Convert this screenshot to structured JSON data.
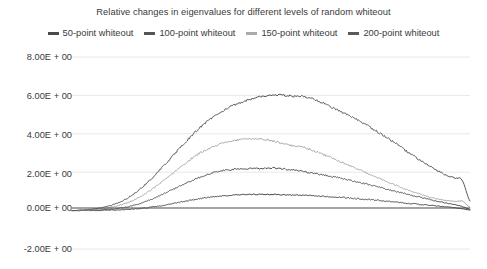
{
  "chart_data": {
    "type": "line",
    "title": "Relative changes in eigenvalues for different levels of random whiteout",
    "xlabel": "",
    "ylabel": "",
    "grid": true,
    "legend_position": "top",
    "ylim": [
      -2.0,
      8.0
    ],
    "ytick_labels": [
      "8.00E + 00",
      "6.00E + 00",
      "4.00E + 00",
      "2.00E + 00",
      "0.00E + 00",
      "-2.00E + 00"
    ],
    "ytick_values": [
      8.0,
      6.0,
      4.0,
      2.0,
      0.0,
      -2.0
    ],
    "xlim": [
      0,
      100
    ],
    "xtick_labels": [],
    "x": [
      0,
      2,
      4,
      6,
      8,
      10,
      12,
      14,
      16,
      18,
      20,
      22,
      24,
      26,
      28,
      30,
      32,
      34,
      36,
      38,
      40,
      42,
      44,
      46,
      48,
      50,
      52,
      54,
      56,
      58,
      60,
      62,
      64,
      66,
      68,
      70,
      72,
      74,
      76,
      78,
      80,
      82,
      84,
      86,
      88,
      90,
      92,
      94,
      96,
      98,
      100
    ],
    "series": [
      {
        "name": "50-point whiteout",
        "color": "#4a4a4a",
        "values": [
          0.0,
          0.0,
          0.01,
          0.01,
          0.02,
          0.03,
          0.04,
          0.06,
          0.09,
          0.13,
          0.18,
          0.24,
          0.31,
          0.39,
          0.47,
          0.55,
          0.62,
          0.68,
          0.73,
          0.77,
          0.8,
          0.82,
          0.83,
          0.84,
          0.84,
          0.84,
          0.83,
          0.82,
          0.81,
          0.8,
          0.78,
          0.76,
          0.73,
          0.71,
          0.68,
          0.65,
          0.62,
          0.58,
          0.55,
          0.51,
          0.47,
          0.43,
          0.39,
          0.35,
          0.31,
          0.27,
          0.23,
          0.19,
          0.15,
          0.1,
          0.03
        ]
      },
      {
        "name": "100-point whiteout",
        "color": "#555555",
        "values": [
          0.0,
          0.01,
          0.02,
          0.03,
          0.05,
          0.08,
          0.13,
          0.2,
          0.3,
          0.43,
          0.59,
          0.77,
          0.97,
          1.17,
          1.37,
          1.56,
          1.73,
          1.88,
          2.0,
          2.08,
          2.13,
          2.16,
          2.18,
          2.2,
          2.21,
          2.22,
          2.2,
          2.15,
          2.1,
          2.04,
          1.98,
          1.9,
          1.83,
          1.75,
          1.66,
          1.57,
          1.48,
          1.38,
          1.28,
          1.18,
          1.07,
          0.97,
          0.87,
          0.77,
          0.67,
          0.57,
          0.48,
          0.4,
          0.32,
          0.22,
          0.07
        ]
      },
      {
        "name": "150-point whiteout",
        "color": "#aaaaaa",
        "values": [
          0.0,
          0.01,
          0.03,
          0.06,
          0.11,
          0.18,
          0.28,
          0.42,
          0.6,
          0.83,
          1.1,
          1.4,
          1.72,
          2.05,
          2.38,
          2.7,
          2.98,
          3.2,
          3.38,
          3.52,
          3.62,
          3.68,
          3.72,
          3.74,
          3.72,
          3.65,
          3.55,
          3.45,
          3.35,
          3.3,
          3.18,
          3.02,
          2.85,
          2.68,
          2.5,
          2.32,
          2.14,
          1.96,
          1.78,
          1.6,
          1.43,
          1.26,
          1.1,
          0.95,
          0.82,
          0.7,
          0.6,
          0.52,
          0.48,
          0.5,
          0.18
        ]
      },
      {
        "name": "200-point whiteout",
        "color": "#595959",
        "values": [
          0.0,
          0.02,
          0.05,
          0.1,
          0.17,
          0.28,
          0.44,
          0.66,
          0.94,
          1.28,
          1.67,
          2.1,
          2.55,
          3.0,
          3.45,
          3.88,
          4.3,
          4.65,
          4.95,
          5.2,
          5.42,
          5.6,
          5.75,
          5.87,
          5.95,
          6.0,
          6.02,
          6.0,
          5.95,
          5.95,
          5.85,
          5.7,
          5.5,
          5.3,
          5.1,
          4.9,
          4.68,
          4.45,
          4.2,
          3.95,
          3.68,
          3.4,
          3.1,
          2.82,
          2.55,
          2.3,
          2.05,
          1.85,
          1.7,
          1.6,
          0.5
        ]
      }
    ]
  },
  "axis": {
    "gridline_color": "#e8e8e8",
    "zeroline_color": "#4a4a4a",
    "label_color": "#3a3a3a"
  }
}
